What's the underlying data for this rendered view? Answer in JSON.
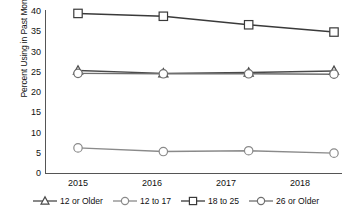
{
  "chart_data": {
    "type": "line",
    "title": "",
    "subtitle": "",
    "xlabel": "",
    "ylabel": "Percent Using in Past Month",
    "categories": [
      "2015",
      "2016",
      "2017",
      "2018"
    ],
    "x": [
      2015,
      2016,
      2017,
      2018
    ],
    "ylim": [
      0,
      40
    ],
    "yticks": [
      0,
      5,
      10,
      15,
      20,
      25,
      30,
      35,
      40
    ],
    "ytick_labels": [
      "0",
      "5",
      "10",
      "15",
      "20",
      "25",
      "30",
      "35",
      "40"
    ],
    "grid": false,
    "legend_position": "bottom",
    "series": [
      {
        "name": "12 or Older",
        "marker": "triangle",
        "color": "#4a4a4a",
        "values": [
          25.3,
          24.6,
          24.8,
          25.2
        ]
      },
      {
        "name": "12 to 17",
        "marker": "circle",
        "color": "#8a8a8a",
        "values": [
          6.2,
          5.3,
          5.5,
          4.9
        ]
      },
      {
        "name": "18 to 25",
        "marker": "square",
        "color": "#3a3a3a",
        "values": [
          39.4,
          38.7,
          36.6,
          34.8
        ]
      },
      {
        "name": "26 or Older",
        "marker": "circle",
        "color": "#6f6f6f",
        "values": [
          24.6,
          24.5,
          24.5,
          24.4
        ]
      }
    ]
  },
  "axes": {
    "ylabel": "Percent Using in Past Month",
    "ytick_labels": [
      "40",
      "35",
      "30",
      "25",
      "20",
      "15",
      "10",
      "5",
      "0"
    ],
    "xtick_labels": [
      "2015",
      "2016",
      "2017",
      "2018"
    ]
  },
  "legend": {
    "items": [
      {
        "label": "12 or Older",
        "marker": "triangle"
      },
      {
        "label": "12 to 17",
        "marker": "circle"
      },
      {
        "label": "18 to 25",
        "marker": "square"
      },
      {
        "label": "26 or Older",
        "marker": "circle"
      }
    ]
  }
}
